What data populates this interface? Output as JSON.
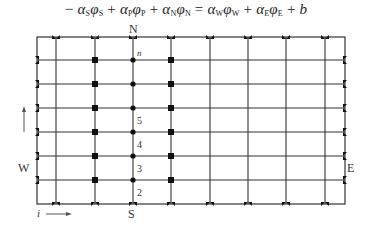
{
  "equation": {
    "terms": [
      {
        "sign": "−",
        "coef": "α",
        "coef_sub": "S",
        "var": "φ",
        "var_sub": "S"
      },
      {
        "sign": "+",
        "coef": "α",
        "coef_sub": "P",
        "var": "φ",
        "var_sub": "P"
      },
      {
        "sign": "+",
        "coef": "α",
        "coef_sub": "N",
        "var": "φ",
        "var_sub": "N"
      },
      {
        "sign": "=",
        "coef": "α",
        "coef_sub": "W",
        "var": "φ",
        "var_sub": "W"
      },
      {
        "sign": "+",
        "coef": "α",
        "coef_sub": "E",
        "var": "φ",
        "var_sub": "E"
      }
    ],
    "tail": "+ b",
    "text": "−α_Sφ_S + α_Pφ_P + α_Nφ_N = α_Wφ_W + α_Eφ_E + b"
  },
  "grid": {
    "frame": {
      "x1": 37,
      "y1": 37,
      "x2": 345,
      "y2": 204
    },
    "vertical_lines_x": [
      56,
      95,
      133,
      171,
      210,
      248,
      286,
      325
    ],
    "horizontal_lines_y": [
      60,
      84,
      108,
      132,
      156,
      180
    ],
    "square_node_columns_x": [
      95,
      171
    ],
    "circle_node_column_x": 133,
    "line_color": "#333333"
  },
  "labels": {
    "north": "N",
    "south": "S",
    "west": "W",
    "east": "E",
    "node_n": "n",
    "row_5": "5",
    "row_4": "4",
    "row_3": "3",
    "row_2": "2",
    "i_axis": "i",
    "j_axis_arrow": "up-arrow",
    "i_axis_arrow": "right-arrow"
  }
}
